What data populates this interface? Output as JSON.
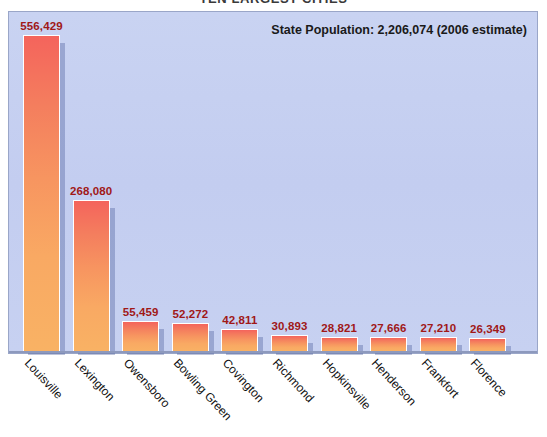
{
  "chart_data": {
    "type": "bar",
    "title": "TEN LARGEST CITIES",
    "xlabel": "",
    "ylabel": "",
    "ylim": [
      0,
      600000
    ],
    "grid": false,
    "legend": "none",
    "annotation": "State Population: 2,206,074 (2006 estimate)",
    "categories": [
      "Louisville",
      "Lexington",
      "Owensboro",
      "Bowling Green",
      "Covington",
      "Richmond",
      "Hopkinsville",
      "Henderson",
      "Frankfort",
      "Florence"
    ],
    "values": [
      556429,
      268080,
      55459,
      52272,
      42811,
      30893,
      28821,
      27666,
      27210,
      26349
    ],
    "value_labels": [
      "556,429",
      "268,080",
      "55,459",
      "52,272",
      "42,811",
      "30,893",
      "28,821",
      "27,666",
      "27,210",
      "26,349"
    ],
    "colors": {
      "bar_top": "#f4645c",
      "bar_bottom": "#f9b264",
      "bar_border": "#ffffff",
      "plot_background": "#c5cff0",
      "plot_border": "#9aa6c8",
      "value_label": "#a01818",
      "page_background": "#ffffff",
      "baseline": "#8d99bd"
    }
  },
  "header": {
    "title": "TEN LARGEST CITIES"
  },
  "annotation": {
    "population_note": "State Population: 2,206,074 (2006 estimate)"
  }
}
